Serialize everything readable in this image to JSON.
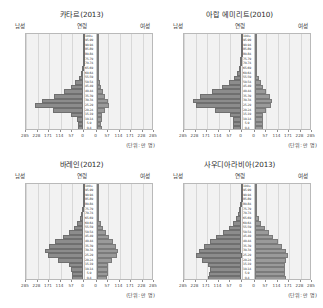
{
  "corner_note": "",
  "labels": {
    "male": "남성",
    "female": "여성",
    "age": "연령",
    "unit": "(단위: 만 명)"
  },
  "axis": {
    "ticks": [
      285,
      228,
      171,
      114,
      57,
      0
    ],
    "max": 285,
    "tick_labels_left": [
      "285",
      "228",
      "171",
      "114",
      "57",
      "0"
    ],
    "tick_labels_right": [
      "0",
      "57",
      "114",
      "171",
      "228",
      "285"
    ]
  },
  "age_groups": [
    "100+",
    "95-99",
    "90-94",
    "85-89",
    "80-84",
    "75-79",
    "70-74",
    "65-69",
    "60-64",
    "55-59",
    "50-54",
    "45-49",
    "40-44",
    "35-39",
    "30-34",
    "25-29",
    "20-24",
    "15-19",
    "10-14",
    "5-9",
    "0-4"
  ],
  "chart_data": {
    "type": "bar",
    "xlabel": "(단위: 만 명)",
    "ylabel": "연령",
    "orientation": "horizontal-diverging",
    "xlim": [
      -285,
      285
    ],
    "grid": true,
    "legend": [
      "남성",
      "여성"
    ],
    "panels": [
      {
        "title": "카타르(2013)",
        "categories": [
          "100+",
          "95-99",
          "90-94",
          "85-89",
          "80-84",
          "75-79",
          "70-74",
          "65-69",
          "60-64",
          "55-59",
          "50-54",
          "45-49",
          "40-44",
          "35-39",
          "30-34",
          "25-29",
          "20-24",
          "15-19",
          "10-14",
          "5-9",
          "0-4"
        ],
        "series": [
          {
            "name": "남성",
            "values": [
              0.1,
              0.2,
              0.4,
              0.8,
              1.5,
              2.5,
              4,
              7,
              13,
              24,
              40,
              62,
              95,
              148,
              208,
              240,
              150,
              62,
              30,
              26,
              26
            ]
          },
          {
            "name": "여성",
            "values": [
              0.1,
              0.2,
              0.4,
              0.7,
              1.2,
              2,
              3,
              5,
              8,
              12,
              17,
              23,
              32,
              44,
              56,
              60,
              42,
              28,
              25,
              24,
              25
            ]
          }
        ]
      },
      {
        "title": "아랍 에미리트(2010)",
        "categories": [
          "100+",
          "95-99",
          "90-94",
          "85-89",
          "80-84",
          "75-79",
          "70-74",
          "65-69",
          "60-64",
          "55-59",
          "50-54",
          "45-49",
          "40-44",
          "35-39",
          "30-34",
          "25-29",
          "20-24",
          "15-19",
          "10-14",
          "5-9",
          "0-4"
        ],
        "series": [
          {
            "name": "남성",
            "values": [
              0.2,
              0.4,
              0.8,
              1.5,
              3,
              5,
              8,
              13,
              22,
              38,
              62,
              95,
              148,
              205,
              242,
              225,
              130,
              58,
              44,
              42,
              44
            ]
          },
          {
            "name": "여성",
            "values": [
              0.2,
              0.4,
              0.7,
              1.3,
              2.4,
              4,
              6,
              9,
              14,
              21,
              30,
              42,
              58,
              76,
              88,
              84,
              58,
              40,
              40,
              40,
              42
            ]
          }
        ]
      },
      {
        "title": "바레인(2012)",
        "categories": [
          "100+",
          "95-99",
          "90-94",
          "85-89",
          "80-84",
          "75-79",
          "70-74",
          "65-69",
          "60-64",
          "55-59",
          "50-54",
          "45-49",
          "40-44",
          "35-39",
          "30-34",
          "25-29",
          "20-24",
          "15-19",
          "10-14",
          "5-9",
          "0-4"
        ],
        "series": [
          {
            "name": "남성",
            "values": [
              0.3,
              0.6,
              1.2,
              2.2,
              4,
              7,
              11,
              18,
              30,
              48,
              72,
              102,
              140,
              172,
              190,
              178,
              124,
              72,
              60,
              58,
              56
            ]
          },
          {
            "name": "여성",
            "values": [
              0.3,
              0.6,
              1.1,
              2,
              3.5,
              6,
              9,
              14,
              22,
              33,
              47,
              63,
              82,
              98,
              106,
              100,
              76,
              58,
              56,
              55,
              54
            ]
          }
        ]
      },
      {
        "title": "사우디아라비아(2013)",
        "categories": [
          "100+",
          "95-99",
          "90-94",
          "85-89",
          "80-84",
          "75-79",
          "70-74",
          "65-69",
          "60-64",
          "55-59",
          "50-54",
          "45-49",
          "40-44",
          "35-39",
          "30-34",
          "25-29",
          "20-24",
          "15-19",
          "10-14",
          "5-9",
          "0-4"
        ],
        "series": [
          {
            "name": "남성",
            "values": [
              0.4,
              0.9,
              1.8,
              3.2,
              6,
              10,
              16,
              26,
              42,
              64,
              92,
              124,
              158,
              188,
              212,
              228,
              196,
              166,
              158,
              160,
              164
            ]
          },
          {
            "name": "여성",
            "values": [
              0.4,
              0.8,
              1.6,
              2.9,
              5.2,
              9,
              14,
              22,
              34,
              50,
              70,
              92,
              116,
              138,
              156,
              168,
              158,
              152,
              150,
              152,
              156
            ]
          }
        ]
      }
    ]
  }
}
